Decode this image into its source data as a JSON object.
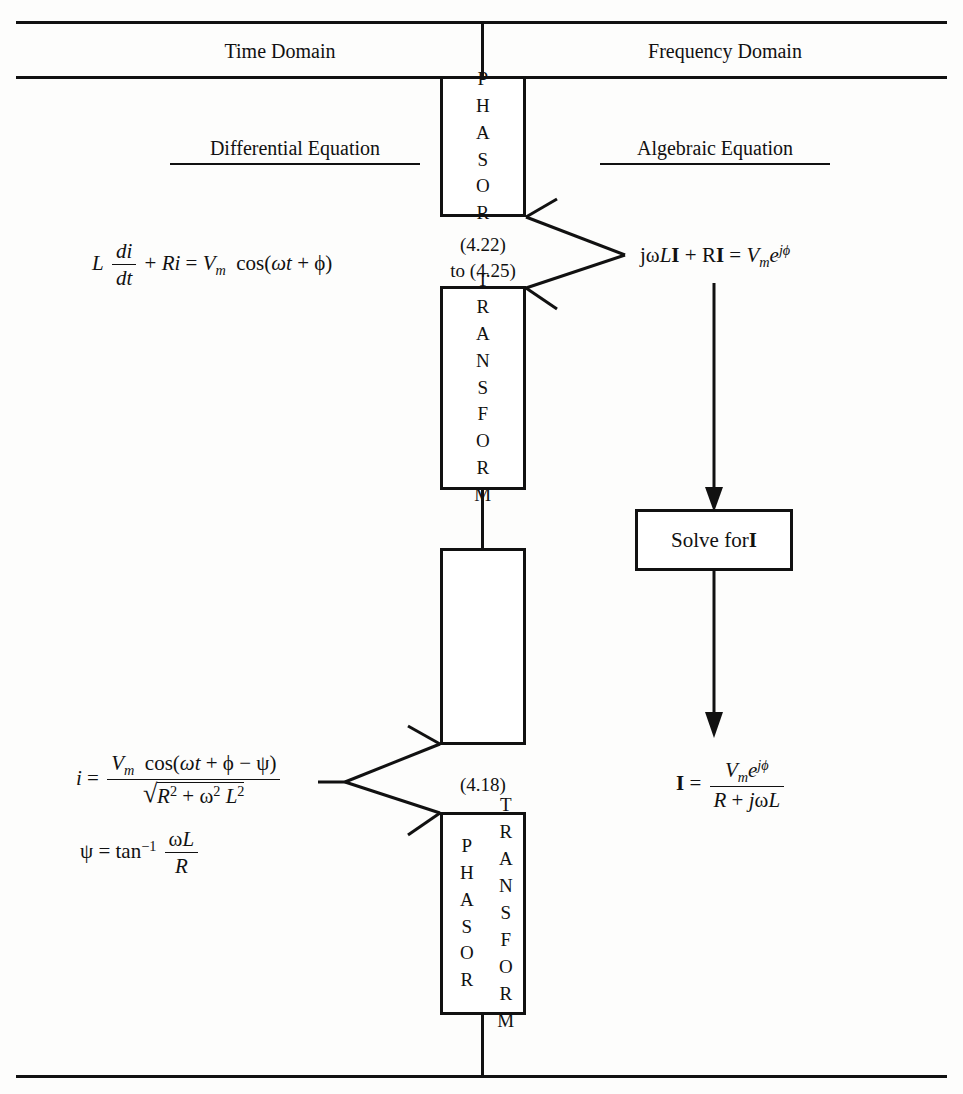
{
  "diagram": {
    "headers": [
      {
        "id": "time-domain",
        "label": "Time Domain"
      },
      {
        "id": "frequency-domain",
        "label": "Frequency Domain"
      }
    ],
    "subheaders": [
      {
        "id": "differential-equation",
        "label": "Differential Equation"
      },
      {
        "id": "algebraic-equation",
        "label": "Algebraic Equation"
      }
    ],
    "boxes": [
      {
        "id": "phasor-box",
        "letters": "PHASOR",
        "columns": 1
      },
      {
        "id": "transform-box",
        "letters": "TRANSFORM",
        "columns": 1
      },
      {
        "id": "empty-box",
        "letters": "",
        "columns": 0
      },
      {
        "id": "phasor-transform-box",
        "col_a": "PHASOR",
        "col_b": "TRANSFORM",
        "columns": 2
      },
      {
        "id": "solve-box",
        "label_prefix": "Solve for ",
        "label_symbol": "I"
      }
    ],
    "equation_refs": [
      {
        "id": "ref-422-425",
        "line1": "(4.22)",
        "line2": "to (4.25)"
      },
      {
        "id": "ref-418",
        "line1": "(4.18)",
        "line2": ""
      }
    ],
    "equations": {
      "differential": {
        "id": "differential-equation-expr",
        "lhs_L": "L",
        "frac_num": "di",
        "frac_den": "dt",
        "plus": "+",
        "Ri": "Ri",
        "equals": "=",
        "V": "V",
        "V_sub": "m",
        "cos_open": "cos(",
        "omega_t": "ωt",
        "plus2": "+",
        "phi": "ϕ",
        "close": ")"
      },
      "algebraic": {
        "id": "algebraic-equation-expr",
        "j": "j",
        "omega": "ω",
        "L": "L",
        "I": "I",
        "plus": "+",
        "R": "R",
        "I2": "I",
        "equals": "=",
        "V": "V",
        "V_sub": "m",
        "e": "e",
        "e_sup": "jϕ"
      },
      "time_solution": {
        "id": "time-solution-expr",
        "i": "i",
        "equals": "=",
        "num_V": "V",
        "num_V_sub": "m",
        "num_cos": "cos(",
        "num_omega_t": "ωt",
        "num_plus": "+",
        "num_phi": "ϕ",
        "num_minus": "−",
        "num_psi": "ψ",
        "num_close": ")",
        "den_R": "R",
        "den_R_sup": "2",
        "den_plus": "+",
        "den_omega": "ω",
        "den_omega_sup": "2",
        "den_L": "L",
        "den_L_sup": "2"
      },
      "psi_definition": {
        "id": "psi-definition-expr",
        "psi": "ψ",
        "equals": "=",
        "tan": "tan",
        "tan_sup": "−1",
        "num_omega": "ω",
        "num_L": "L",
        "den_R": "R"
      },
      "phasor_solution": {
        "id": "phasor-solution-expr",
        "I": "I",
        "equals": "=",
        "num_V": "V",
        "num_V_sub": "m",
        "num_e": "e",
        "num_e_sup": "jϕ",
        "den_R": "R",
        "den_plus": "+",
        "den_j": "j",
        "den_omega": "ω",
        "den_L": "L"
      }
    },
    "colors": {
      "ink": "#111111",
      "paper": "#fdfdfc"
    }
  }
}
